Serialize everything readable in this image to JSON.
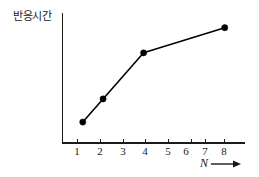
{
  "chart_data": {
    "type": "line",
    "title": "",
    "subtitle": "",
    "xlabel": "N",
    "ylabel": "반응시간",
    "x": [
      1,
      2,
      4,
      8
    ],
    "values": [
      1.0,
      2.1,
      4.3,
      5.5
    ],
    "series": [
      {
        "name": "반응시간",
        "x": [
          1,
          2,
          4,
          8
        ],
        "values": [
          1.0,
          2.1,
          4.3,
          5.5
        ]
      }
    ],
    "xticks": [
      1,
      2,
      3,
      4,
      5,
      6,
      7,
      8
    ],
    "xticklabels": [
      "1",
      "2",
      "3",
      "4",
      "5",
      "6",
      "7",
      "8"
    ],
    "yticks": [],
    "yticklabels": [],
    "xlim": [
      0,
      9
    ],
    "ylim": [
      0,
      6.2
    ],
    "grid": false,
    "legend": false,
    "legend_position": "none",
    "marker": "filled-circle",
    "line_color": "#000000",
    "marker_color": "#000000",
    "axis_color": "#1a1a1a",
    "background_color": "#ffffff",
    "annotations": [
      {
        "name": "x-axis-arrow",
        "text": "N",
        "symbol": "→",
        "position": "below-right-of-x-axis"
      }
    ]
  },
  "axes": {
    "y_axis_label": "반응시간",
    "x_axis_label": "N",
    "x_axis_arrow_glyph": "→"
  },
  "ticks": {
    "x": [
      "1",
      "2",
      "3",
      "4",
      "5",
      "6",
      "7",
      "8"
    ]
  }
}
